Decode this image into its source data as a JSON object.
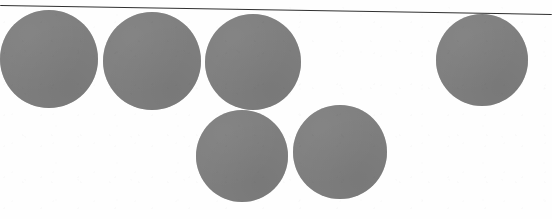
{
  "figure": {
    "title": "Circle Diagram",
    "caption": "Six solid gray circles arranged in two rows beneath a thin horizontal rule",
    "background_color": "#fefefe",
    "width": 552,
    "height": 219
  },
  "rule": {
    "label": "horizontal-rule",
    "color": "#1d1d1d",
    "x1": 0,
    "y1": 5,
    "x2": 552,
    "y2": 14,
    "thickness": 1.4
  },
  "circles": [
    {
      "label": "circle-1",
      "row": "top",
      "index": 1,
      "cx": 49,
      "cy": 59,
      "r": 49,
      "color": "#7f7f7f"
    },
    {
      "label": "circle-2",
      "row": "top",
      "index": 2,
      "cx": 152,
      "cy": 61,
      "r": 49,
      "color": "#7f7f7f"
    },
    {
      "label": "circle-3",
      "row": "top",
      "index": 3,
      "cx": 253,
      "cy": 62,
      "r": 48,
      "color": "#7f7f7f"
    },
    {
      "label": "circle-4",
      "row": "top",
      "index": 4,
      "cx": 482,
      "cy": 60,
      "r": 46,
      "color": "#7f7f7f"
    },
    {
      "label": "circle-5",
      "row": "bottom",
      "index": 5,
      "cx": 242,
      "cy": 156,
      "r": 46,
      "color": "#7f7f7f"
    },
    {
      "label": "circle-6",
      "row": "bottom",
      "index": 6,
      "cx": 340,
      "cy": 152,
      "r": 47,
      "color": "#7f7f7f"
    }
  ]
}
